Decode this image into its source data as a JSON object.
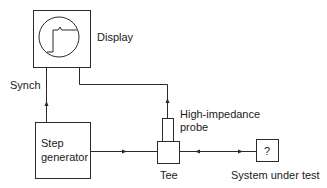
{
  "diagram": {
    "colors": {
      "stroke": "#2a2a2a",
      "text": "#1a1a1a",
      "background": "#ffffff"
    },
    "nodes": {
      "display": {
        "label": "Display",
        "icon": "oscilloscope-screen-step-waveform"
      },
      "step_generator": {
        "label_line1": "Step",
        "label_line2": "generator"
      },
      "probe": {
        "label_line1": "High-impedance",
        "label_line2": "probe"
      },
      "tee": {
        "label": "Tee"
      },
      "system_under_test": {
        "symbol": "?",
        "label": "System under test"
      }
    },
    "edges": [
      {
        "from": "step_generator",
        "to": "display",
        "label": "Synch",
        "direction": "up"
      },
      {
        "from": "step_generator",
        "to": "tee",
        "direction": "right"
      },
      {
        "from": "tee",
        "to": "probe",
        "direction": "up"
      },
      {
        "from": "probe",
        "to": "display",
        "direction": "up-left"
      },
      {
        "from": "tee",
        "to": "system_under_test",
        "direction": "bidirectional"
      }
    ]
  }
}
